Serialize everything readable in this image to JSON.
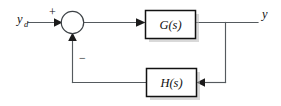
{
  "diagram": {
    "type": "control-block-diagram",
    "background_color": "#ffffff",
    "width": 281,
    "height": 106,
    "wire_color": "#555a5e",
    "block_border_color": "#121212",
    "text_color": "#111111",
    "shadow_color": "#b9b9b9"
  },
  "signals": {
    "input_label": "y",
    "input_subscript": "d",
    "output_label": "y"
  },
  "summing_junction": {
    "name": "summing-junction",
    "shape": "circle",
    "positive_sign": "+",
    "negative_sign": "−"
  },
  "blocks": [
    {
      "id": "forward-block",
      "label": "G(s)",
      "role": "forward-path-transfer-function"
    },
    {
      "id": "feedback-block",
      "label": "H(s)",
      "role": "feedback-path-transfer-function"
    }
  ],
  "wires": [
    {
      "id": "input-wire",
      "from": "input",
      "to": "summing-junction"
    },
    {
      "id": "error-wire",
      "from": "summing-junction",
      "to": "forward-block"
    },
    {
      "id": "output-wire",
      "from": "forward-block",
      "to": "output"
    },
    {
      "id": "takeoff-wire",
      "from": "output-takeoff",
      "to": "feedback-block"
    },
    {
      "id": "feedback-wire",
      "from": "feedback-block",
      "to": "summing-junction"
    }
  ]
}
